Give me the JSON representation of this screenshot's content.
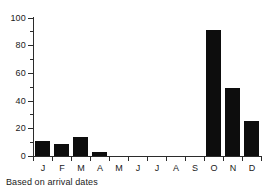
{
  "caption": "Based on arrival dates",
  "chart_data": {
    "type": "bar",
    "title": "",
    "subtitle": "",
    "xlabel": "",
    "ylabel": "",
    "categories": [
      "J",
      "F",
      "M",
      "A",
      "M",
      "J",
      "J",
      "A",
      "S",
      "O",
      "N",
      "D"
    ],
    "values": [
      11,
      9,
      14,
      3,
      0,
      0,
      0,
      0,
      0,
      91,
      49,
      25
    ],
    "series": [
      {
        "name": "Arrivals",
        "values": [
          11,
          9,
          14,
          3,
          0,
          0,
          0,
          0,
          0,
          91,
          49,
          25
        ]
      }
    ],
    "ylim": [
      0,
      100
    ],
    "ytick_labels": [
      "0",
      "20",
      "40",
      "60",
      "80",
      "100"
    ],
    "ytick_values": [
      0,
      20,
      40,
      60,
      80,
      100
    ],
    "yminor_values": [
      10,
      30,
      50,
      70,
      90
    ],
    "xtick_labels": [
      "J",
      "F",
      "M",
      "A",
      "M",
      "J",
      "J",
      "A",
      "S",
      "O",
      "N",
      "D"
    ],
    "grid": false,
    "legend": [],
    "legend_position": "none",
    "annotations": [
      "Based on arrival dates"
    ],
    "bar_color": "#0d0d0d",
    "axis_color": "#2b2b2b",
    "background_color": "#ffffff"
  }
}
